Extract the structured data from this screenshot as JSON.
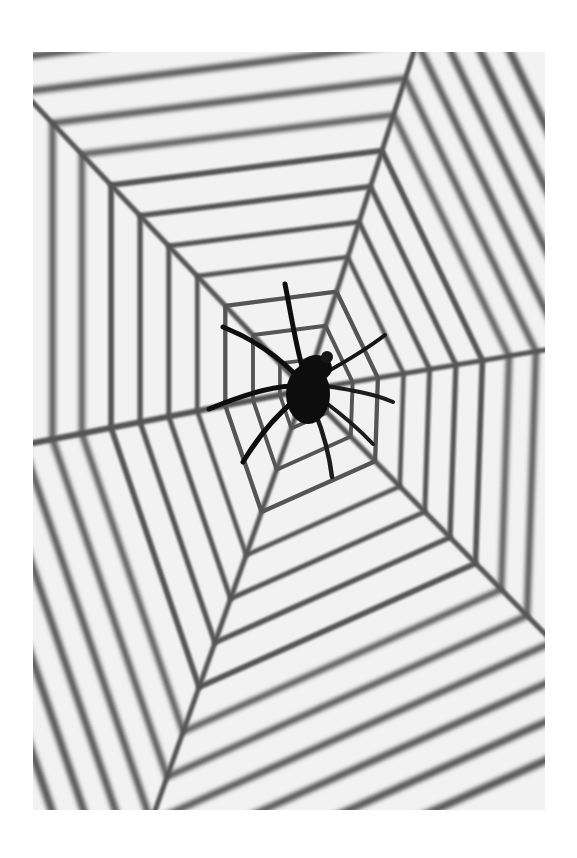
{
  "image": {
    "subject": "plastic spider on hexagonal spider web",
    "background_color": "#f2f2f2",
    "page_color": "#ffffff",
    "web_color": "#555555",
    "spider_color": "#111111",
    "frame": {
      "x": 33,
      "y": 52,
      "width": 512,
      "height": 758
    }
  },
  "web": {
    "hub": {
      "x": 272,
      "y": 338
    },
    "spokes": [
      {
        "name": "up-right",
        "end": {
          "x": 384,
          "y": -10
        }
      },
      {
        "name": "right",
        "end": {
          "x": 530,
          "y": 295
        }
      },
      {
        "name": "down-right",
        "end": {
          "x": 520,
          "y": 590
        }
      },
      {
        "name": "down-left",
        "end": {
          "x": 118,
          "y": 770
        }
      },
      {
        "name": "left",
        "end": {
          "x": -10,
          "y": 393
        }
      },
      {
        "name": "up-left",
        "end": {
          "x": -10,
          "y": 40
        }
      }
    ],
    "ring_count": 13
  },
  "spider": {
    "body_center": {
      "x": 278,
      "y": 332
    },
    "legs": 8
  }
}
